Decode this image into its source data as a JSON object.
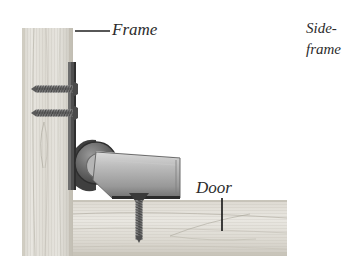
{
  "figure": {
    "domain": "diagram",
    "style": "grayscale halftone photo illustration on white background",
    "background_color": "#ffffff"
  },
  "labels": {
    "frame": "Frame",
    "door": "Door",
    "side_line1": "Side-",
    "side_line2": "frame"
  },
  "colors": {
    "wood_light": "#e2e0da",
    "wood_mid": "#cfccc4",
    "wood_dark": "#b4b0a6",
    "grain_line": "#a9a59a",
    "metal_light": "#cbcbcb",
    "metal_mid": "#9d9d9d",
    "metal_dark": "#5f5f5f",
    "knuckle_dark": "#4a4a4a",
    "screw_gray": "#7a7a7a",
    "text": "#2b2b2b",
    "leader": "#1f1f1f"
  },
  "parts": {
    "frame_board": {
      "name": "Frame",
      "orientation": "vertical",
      "x": 22,
      "y": 28,
      "width": 51,
      "height": 228
    },
    "door_board": {
      "name": "Door",
      "orientation": "horizontal",
      "x": 73,
      "y": 200,
      "width": 214,
      "height": 56
    },
    "hinge_leaf_frame": {
      "name": "hinge leaf fastened to frame",
      "x": 68,
      "y": 62,
      "width": 8,
      "height": 128
    },
    "hinge_knuckle": {
      "name": "hinge knuckle barrel",
      "cx": 96,
      "cy": 163,
      "r": 20
    },
    "hinge_pivot_pin": {
      "name": "pivot pin",
      "cx": 100,
      "cy": 167,
      "r": 5
    },
    "hinge_leaf_door": {
      "name": "hinge leaf fastened to door",
      "from_x": 96,
      "from_y": 176,
      "to_x": 180,
      "to_y": 198
    }
  },
  "fasteners": {
    "frame_screws": [
      {
        "name": "upper frame screw",
        "orientation": "horizontal",
        "y": 89,
        "x_start": 36,
        "x_end": 73
      },
      {
        "name": "lower frame screw",
        "orientation": "horizontal",
        "y": 113,
        "x_start": 36,
        "x_end": 73
      }
    ],
    "door_screws": [
      {
        "name": "door screw",
        "orientation": "vertical",
        "x": 139,
        "y_start": 196,
        "y_end": 240
      }
    ]
  },
  "leaders": [
    {
      "name": "frame-leader",
      "type": "horizontal",
      "x1": 75,
      "x2": 110,
      "y": 31
    },
    {
      "name": "door-leader",
      "type": "vertical",
      "x": 222,
      "y1": 198,
      "y2": 231
    }
  ]
}
